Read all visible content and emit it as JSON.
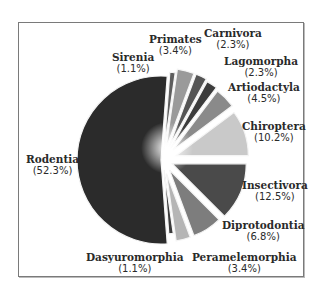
{
  "chart_data": {
    "type": "pie",
    "title": "",
    "exploded": true,
    "slices": [
      {
        "label": "Rodentia",
        "value": 52.3,
        "pct_text": "(52.3%)",
        "color": "#2b2b2b"
      },
      {
        "label": "Sirenia",
        "value": 1.1,
        "pct_text": "(1.1%)",
        "color": "#5e5e5e"
      },
      {
        "label": "Primates",
        "value": 3.4,
        "pct_text": "(3.4%)",
        "color": "#9a9a9a"
      },
      {
        "label": "Carnivora",
        "value": 2.3,
        "pct_text": "(2.3%)",
        "color": "#555555"
      },
      {
        "label": "Lagomorpha",
        "value": 2.3,
        "pct_text": "(2.3%)",
        "color": "#3c3c3c"
      },
      {
        "label": "Artiodactyla",
        "value": 4.5,
        "pct_text": "(4.5%)",
        "color": "#8a8a8a"
      },
      {
        "label": "Chiroptera",
        "value": 10.2,
        "pct_text": "(10.2%)",
        "color": "#c9c9c9"
      },
      {
        "label": "Insectivora",
        "value": 12.5,
        "pct_text": "(12.5%)",
        "color": "#4a4a4a"
      },
      {
        "label": "Diprotodontia",
        "value": 6.8,
        "pct_text": "(6.8%)",
        "color": "#7d7d7d"
      },
      {
        "label": "Peramelemorphia",
        "value": 3.4,
        "pct_text": "(3.4%)",
        "color": "#b5b5b5"
      },
      {
        "label": "Dasyuromorphia",
        "value": 1.1,
        "pct_text": "(1.1%)",
        "color": "#3a3a3a"
      }
    ],
    "legend": "none (direct labels)"
  },
  "labels": [
    {
      "name": "Rodentia",
      "pct": "(52.3%)"
    },
    {
      "name": "Sirenia",
      "pct": "(1.1%)"
    },
    {
      "name": "Primates",
      "pct": "(3.4%)"
    },
    {
      "name": "Carnivora",
      "pct": "(2.3%)"
    },
    {
      "name": "Lagomorpha",
      "pct": "(2.3%)"
    },
    {
      "name": "Artiodactyla",
      "pct": "(4.5%)"
    },
    {
      "name": "Chiroptera",
      "pct": "(10.2%)"
    },
    {
      "name": "Insectivora",
      "pct": "(12.5%)"
    },
    {
      "name": "Diprotodontia",
      "pct": "(6.8%)"
    },
    {
      "name": "Peramelemorphia",
      "pct": "(3.4%)"
    },
    {
      "name": "Dasyuromorphia",
      "pct": "(1.1%)"
    }
  ]
}
